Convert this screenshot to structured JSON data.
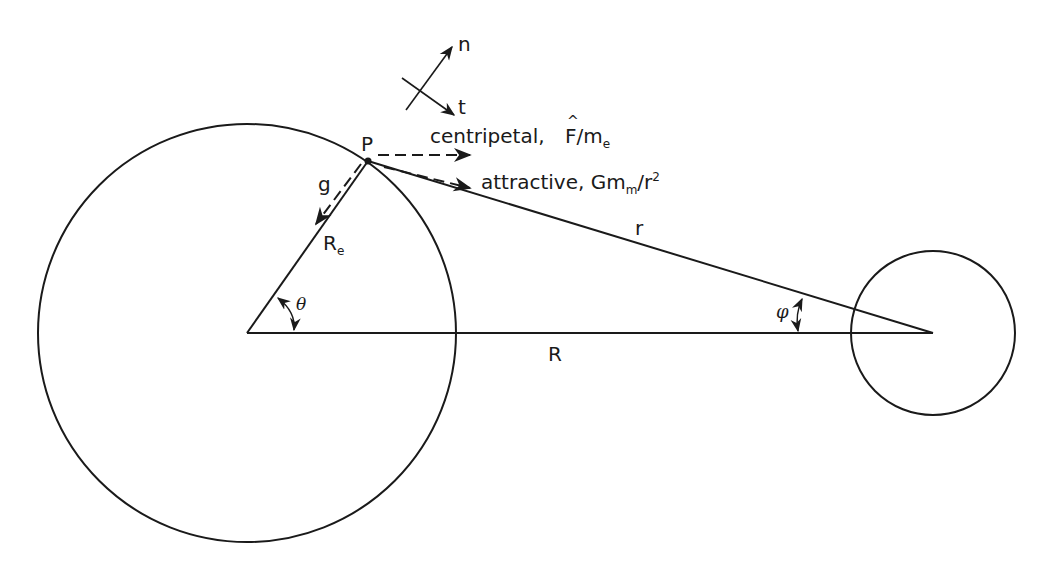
{
  "diagram": {
    "colors": {
      "stroke": "#1a1a1a",
      "background": "#ffffff"
    },
    "bodies": [
      {
        "name": "earth",
        "cx": 247,
        "cy": 333,
        "r": 209
      },
      {
        "name": "moon",
        "cx": 933,
        "cy": 333,
        "r": 82
      }
    ],
    "point": {
      "label": "P",
      "x": 368,
      "y": 161
    },
    "labels": {
      "P": "P",
      "n": "n",
      "t": "t",
      "g": "g",
      "Re_main": "R",
      "Re_sub": "e",
      "theta": "θ",
      "phi": "φ",
      "r_small": "r",
      "R_big": "R",
      "centripetal_prefix": "centripetal,",
      "centripetal_F": "F",
      "centripetal_slash": "/m",
      "centripetal_sub": "e",
      "attractive_prefix": "attractive,",
      "attractive_G": "Gm",
      "attractive_sub": "m",
      "attractive_slash": "/r",
      "attractive_sup": "2"
    },
    "vectors": [
      {
        "name": "normal-n",
        "from": [
          406,
          110
        ],
        "to": [
          452,
          47
        ]
      },
      {
        "name": "tangent-t",
        "from": [
          402,
          78
        ],
        "to": [
          454,
          115
        ]
      },
      {
        "name": "centripetal",
        "from": [
          378,
          155
        ],
        "to": [
          470,
          155
        ],
        "dashed": true
      },
      {
        "name": "attractive",
        "from": [
          384,
          167
        ],
        "to": [
          470,
          188
        ],
        "dashed": true
      },
      {
        "name": "gravity-g",
        "from": [
          362,
          166
        ],
        "to": [
          316,
          224
        ],
        "dashed": true
      }
    ]
  }
}
